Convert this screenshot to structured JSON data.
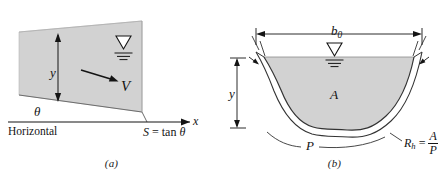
{
  "figure": {
    "fill_color": "#d2d2d2",
    "line_color": "#141414",
    "background": "#ffffff"
  },
  "panel_a": {
    "caption": "(a)",
    "labels": {
      "depth": "y",
      "velocity": "V",
      "angle": "θ",
      "horizontal": "Horizontal",
      "axis_x": "x",
      "slope_expr_lhs": "S",
      "slope_expr_eq": "=",
      "slope_expr_rhs": "tan θ",
      "slope_full": "S = tan θ"
    },
    "icons": {
      "water_surface": "water-surface-triangle-icon",
      "velocity_arrow": "velocity-arrow-icon",
      "depth_dimension": "depth-dimension-arrow-icon",
      "x_axis_arrow": "x-axis-arrow-icon"
    }
  },
  "panel_b": {
    "caption": "(b)",
    "labels": {
      "top_width": "b",
      "top_width_sub": "0",
      "depth": "y",
      "area": "A",
      "perimeter": "P",
      "rh_symbol": "R",
      "rh_sub": "h",
      "rh_eq": "=",
      "rh_num": "A",
      "rh_den": "P",
      "rh_full": "R_h = A/P"
    },
    "icons": {
      "water_surface": "water-surface-triangle-icon",
      "width_dimension": "top-width-dimension-icon",
      "depth_dimension": "depth-dimension-arrow-icon",
      "perimeter_leader": "perimeter-leader-line-icon",
      "rh_leader": "hydraulic-radius-leader-line-icon"
    }
  }
}
